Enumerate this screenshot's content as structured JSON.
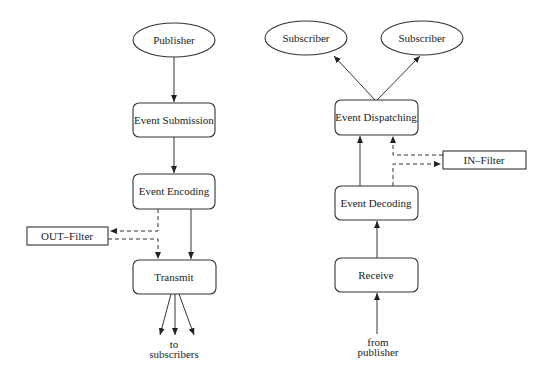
{
  "diagram": {
    "left": {
      "publisher": "Publisher",
      "event_submission": "Event Submission",
      "event_encoding": "Event Encoding",
      "out_filter": "OUT–Filter",
      "transmit": "Transmit",
      "to_label_line1": "to",
      "to_label_line2": "subscribers"
    },
    "right": {
      "subscriber_1": "Subscriber",
      "subscriber_2": "Subscriber",
      "event_dispatching": "Event Dispatching",
      "in_filter": "IN–Filter",
      "event_decoding": "Event Decoding",
      "receive": "Receive",
      "from_label_line1": "from",
      "from_label_line2": "publisher"
    },
    "edges": [
      {
        "from": "Publisher",
        "to": "Event Submission",
        "style": "solid"
      },
      {
        "from": "Event Submission",
        "to": "Event Encoding",
        "style": "solid"
      },
      {
        "from": "Event Encoding",
        "to": "Transmit",
        "style": "solid"
      },
      {
        "from": "Event Encoding",
        "to": "OUT–Filter",
        "style": "dashed"
      },
      {
        "from": "OUT–Filter",
        "to": "Transmit",
        "style": "dashed"
      },
      {
        "from": "Transmit",
        "to": "to subscribers",
        "style": "solid",
        "count": 3
      },
      {
        "from": "from publisher",
        "to": "Receive",
        "style": "solid"
      },
      {
        "from": "Receive",
        "to": "Event Decoding",
        "style": "solid"
      },
      {
        "from": "Event Decoding",
        "to": "Event Dispatching",
        "style": "solid"
      },
      {
        "from": "Event Decoding",
        "to": "IN–Filter",
        "style": "dashed"
      },
      {
        "from": "IN–Filter",
        "to": "Event Dispatching",
        "style": "dashed"
      },
      {
        "from": "Event Dispatching",
        "to": "Subscriber",
        "style": "solid"
      },
      {
        "from": "Event Dispatching",
        "to": "Subscriber",
        "style": "solid"
      }
    ]
  }
}
